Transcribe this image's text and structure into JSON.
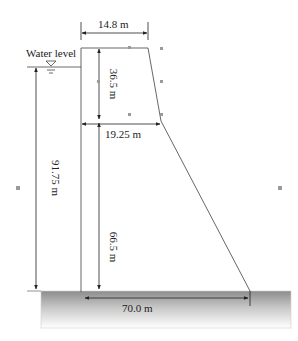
{
  "diagram": {
    "type": "gravity-dam-cross-section",
    "labels": {
      "water_level": "Water level",
      "crest_width": "14.8 m",
      "upper_height": "36.5 m",
      "break_width": "19.25 m",
      "water_depth": "91.75 m",
      "lower_height": "66.5 m",
      "base_width": "70.0 m"
    },
    "colors": {
      "line": "#555555",
      "text": "#222222",
      "ground_top": "#8a8a8a",
      "ground_bottom": "#ffffff",
      "handle": "#9a9a9a"
    }
  }
}
